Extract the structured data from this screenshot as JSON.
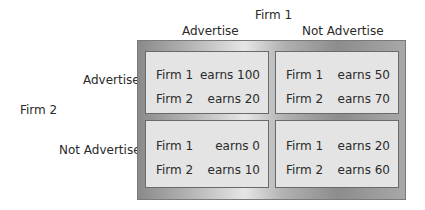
{
  "diagram": {
    "title_top": "Firm 1",
    "col_headers": [
      "Advertise",
      "Not Advertise"
    ],
    "row_player": "Firm 2",
    "row_headers": [
      "Advertise",
      "Not Advertise"
    ],
    "cells": [
      [
        {
          "r1_label": "Firm 1",
          "r1_value": "earns 100",
          "r2_label": "Firm 2",
          "r2_value": "earns 20"
        },
        {
          "r1_label": "Firm 1",
          "r1_value": "earns 50",
          "r2_label": "Firm 2",
          "r2_value": "earns 70"
        }
      ],
      [
        {
          "r1_label": "Firm 1",
          "r1_value": "earns 0",
          "r2_label": "Firm 2",
          "r2_value": "earns 10"
        },
        {
          "r1_label": "Firm 1",
          "r1_value": "earns 20",
          "r2_label": "Firm 2",
          "r2_value": "earns 60"
        }
      ]
    ]
  }
}
